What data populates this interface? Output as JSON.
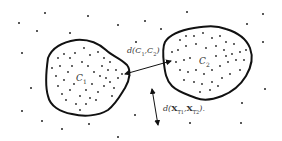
{
  "diagram": {
    "type": "cluster-distance-illustration",
    "clusters": [
      {
        "id": "C1",
        "label": "C",
        "subscript": "1",
        "label_pos": [
          76,
          74
        ]
      },
      {
        "id": "C2",
        "label": "C",
        "subscript": "2",
        "label_pos": [
          199,
          57
        ]
      }
    ],
    "inter_cluster_distance": {
      "label": "d(C₁,C₂)",
      "text_main": "d(C",
      "sub1": "1",
      "mid": ",C",
      "sub2": "2",
      "end": ")",
      "pos": [
        127,
        47
      ]
    },
    "point_distance": {
      "label": "d(X_T1,X_T2)",
      "text_main": "d(",
      "x1": "X",
      "sub1": "T1",
      "comma": ",",
      "x2": "X",
      "sub2": "T2",
      "end": ").",
      "pos": [
        163,
        104
      ]
    },
    "colors": {
      "stroke": "#111111",
      "point": "#222222",
      "text": "#333333"
    }
  }
}
